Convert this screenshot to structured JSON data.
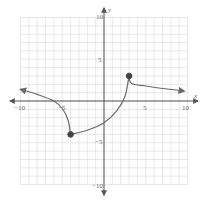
{
  "chart_data": {
    "type": "line",
    "title": "",
    "xlabel": "x",
    "ylabel": "y",
    "xlim": [
      -10,
      10
    ],
    "ylim": [
      -10,
      10
    ],
    "grid": true,
    "tick_labels": {
      "x": [
        "-10",
        "-5",
        "5",
        "10"
      ],
      "y": [
        "10",
        "5",
        "-5",
        "-10"
      ]
    },
    "series": [
      {
        "name": "left branch",
        "points": [
          [
            -10,
            1.4
          ],
          [
            -8,
            0.8
          ],
          [
            -6,
            0
          ],
          [
            -5,
            -0.9
          ],
          [
            -4.3,
            -2.3
          ],
          [
            -4,
            -4
          ]
        ],
        "left_end": "arrow",
        "right_end": "closed-dot"
      },
      {
        "name": "middle branch",
        "points": [
          [
            -4,
            -4
          ],
          [
            -2,
            -3.5
          ],
          [
            0,
            -2.6
          ],
          [
            1.5,
            -1.2
          ],
          [
            2.5,
            0.5
          ],
          [
            3,
            3
          ]
        ],
        "left_end": "closed-dot",
        "right_end": "closed-dot"
      },
      {
        "name": "right branch",
        "points": [
          [
            3,
            3
          ],
          [
            3.3,
            2.1
          ],
          [
            5,
            1.8
          ],
          [
            7,
            1.5
          ],
          [
            9.6,
            1.2
          ]
        ],
        "left_end": "closed-dot",
        "right_end": "arrow"
      }
    ],
    "points": [
      {
        "x": -4,
        "y": -4,
        "style": "closed"
      },
      {
        "x": 3,
        "y": 3,
        "style": "closed"
      }
    ],
    "colors": {
      "curve": "#6a6a6a",
      "axis": "#555555",
      "grid": "#d6d6d6"
    }
  },
  "labels": {
    "x_axis": "x",
    "y_axis": "y",
    "x_neg10": "−10",
    "x_neg5": "−5",
    "x_pos5": "5",
    "x_pos10": "10",
    "y_pos10": "10",
    "y_pos5": "5",
    "y_neg5": "−5",
    "y_neg10": "−10"
  }
}
